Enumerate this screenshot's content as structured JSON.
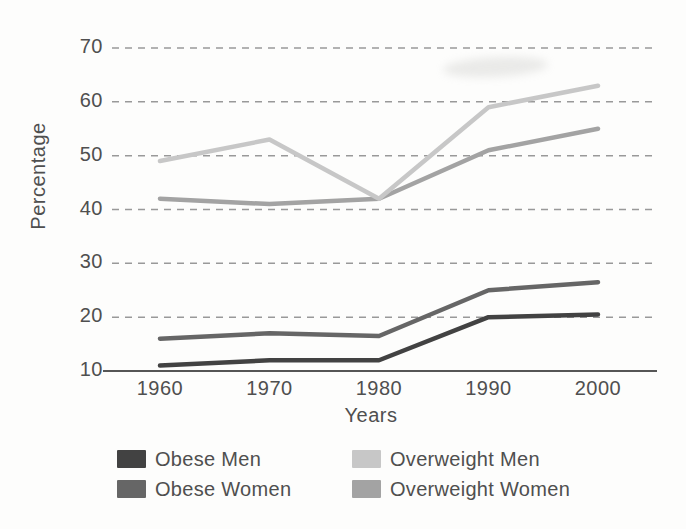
{
  "chart_data": {
    "type": "line",
    "title": "",
    "xlabel": "Years",
    "ylabel": "Percentage",
    "x": [
      1960,
      1970,
      1980,
      1990,
      2000
    ],
    "ylim": [
      10,
      70
    ],
    "yticks": [
      10,
      20,
      30,
      40,
      50,
      60,
      70
    ],
    "grid": "horizontal-dashed, solid baseline at y=10",
    "legend_position": "bottom, two columns",
    "series": [
      {
        "name": "Obese Men",
        "color": "#424242",
        "values": [
          11,
          12,
          12,
          20,
          20.5
        ]
      },
      {
        "name": "Obese Women",
        "color": "#666666",
        "values": [
          16,
          17,
          16.5,
          25,
          26.5
        ]
      },
      {
        "name": "Overweight Men",
        "color": "#c7c7c7",
        "values": [
          49,
          53,
          42,
          59,
          63
        ]
      },
      {
        "name": "Overweight Women",
        "color": "#a3a3a3",
        "values": [
          42,
          41,
          42,
          51,
          55
        ]
      }
    ]
  },
  "legend": {
    "items": [
      {
        "label": "Obese Men",
        "color": "#424242"
      },
      {
        "label": "Obese Women",
        "color": "#666666"
      },
      {
        "label": "Overweight Men",
        "color": "#c7c7c7"
      },
      {
        "label": "Overweight Women",
        "color": "#a3a3a3"
      }
    ]
  },
  "colors": {
    "grid": "#999999",
    "axis": "#565656",
    "text": "#4f4f4f",
    "background": "#fdfdfc"
  }
}
